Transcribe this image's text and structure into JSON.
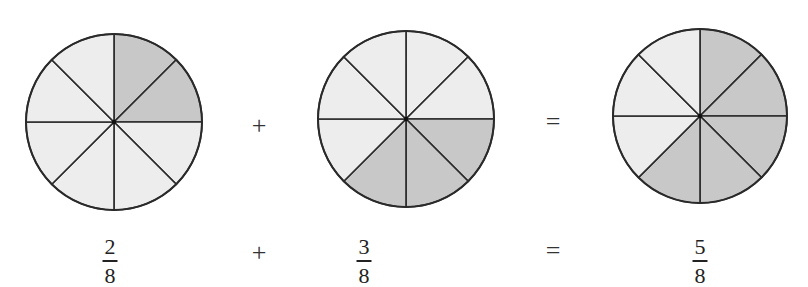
{
  "colors": {
    "shaded": "#c8c8c8",
    "unshaded": "#ededed",
    "stroke": "#2a2a2a"
  },
  "circles": [
    {
      "label": "two-eighths",
      "cx": 114,
      "cy": 122,
      "r": 88,
      "slices": 8,
      "shaded_slices": [
        0,
        1
      ]
    },
    {
      "label": "three-eighths",
      "cx": 406,
      "cy": 119,
      "r": 88,
      "slices": 8,
      "shaded_slices": [
        2,
        3,
        4
      ]
    },
    {
      "label": "five-eighths",
      "cx": 700,
      "cy": 116,
      "r": 87,
      "slices": 8,
      "shaded_slices": [
        0,
        1,
        2,
        3,
        4
      ]
    }
  ],
  "operators_top": {
    "plus": "+",
    "equals": "="
  },
  "equation": {
    "term1": {
      "numerator": "2",
      "denominator": "8"
    },
    "plus": "+",
    "term2": {
      "numerator": "3",
      "denominator": "8"
    },
    "equals": "=",
    "result": {
      "numerator": "5",
      "denominator": "8"
    }
  }
}
